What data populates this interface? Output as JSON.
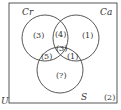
{
  "diagram": {
    "type": "venn-3",
    "universe_label": "U",
    "universe_count": "(2)",
    "sets": [
      {
        "name": "Cr",
        "only_count": "(3)"
      },
      {
        "name": "Ca",
        "only_count": "(1)"
      },
      {
        "name": "S",
        "only_count": "(?)"
      }
    ],
    "intersections": {
      "cr_ca_only": "(4)",
      "cr_s_only": "(5)",
      "ca_s_only": "(1)",
      "all_three": "(3)"
    }
  }
}
